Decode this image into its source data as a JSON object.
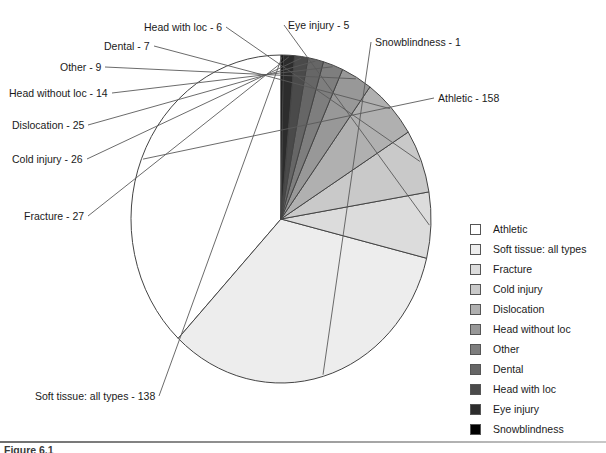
{
  "figure": {
    "caption": "Figure 6.1",
    "background": "#ffffff",
    "outline_color": "#444444"
  },
  "chart_data": {
    "type": "pie",
    "title": "",
    "total": 416,
    "units": "cases",
    "start_angle_deg": 90,
    "direction": "counterclockwise",
    "center": {
      "x": 281,
      "y": 219
    },
    "radius": {
      "rx": 150,
      "ry": 164
    },
    "categories": [
      "Athletic",
      "Soft tissue: all types",
      "Fracture",
      "Cold injury",
      "Dislocation",
      "Head without loc",
      "Other",
      "Dental",
      "Head with loc",
      "Eye injury",
      "Snowblindness"
    ],
    "values": [
      158,
      138,
      27,
      26,
      25,
      14,
      9,
      7,
      6,
      5,
      1
    ],
    "colors": [
      "#ffffff",
      "#ededed",
      "#dcdcdc",
      "#c9c9c9",
      "#b0b0b0",
      "#989898",
      "#7e7e7e",
      "#666666",
      "#4a4a4a",
      "#2c2c2c",
      "#000000"
    ],
    "legend_position": "right",
    "grid": false
  },
  "callouts": [
    {
      "text": "Athletic - 158",
      "x": 438,
      "y": 92
    },
    {
      "text": "Snowblindness - 1",
      "x": 375,
      "y": 36
    },
    {
      "text": "Eye injury - 5",
      "x": 288,
      "y": 19
    },
    {
      "text": "Head with loc - 6",
      "x": 144,
      "y": 21
    },
    {
      "text": "Dental - 7",
      "x": 104,
      "y": 40
    },
    {
      "text": "Other - 9",
      "x": 60,
      "y": 61
    },
    {
      "text": "Head without loc - 14",
      "x": 9,
      "y": 87
    },
    {
      "text": "Dislocation - 25",
      "x": 12,
      "y": 119
    },
    {
      "text": "Cold injury - 26",
      "x": 12,
      "y": 153
    },
    {
      "text": "Fracture - 27",
      "x": 24,
      "y": 210
    },
    {
      "text": "Soft tissue: all types - 138",
      "x": 35,
      "y": 390
    }
  ],
  "legend": {
    "items": [
      {
        "label": "Athletic",
        "color": "#ffffff"
      },
      {
        "label": "Soft tissue: all types",
        "color": "#ededed"
      },
      {
        "label": "Fracture",
        "color": "#dcdcdc"
      },
      {
        "label": "Cold injury",
        "color": "#c9c9c9"
      },
      {
        "label": "Dislocation",
        "color": "#b0b0b0"
      },
      {
        "label": "Head without loc",
        "color": "#989898"
      },
      {
        "label": "Other",
        "color": "#7e7e7e"
      },
      {
        "label": "Dental",
        "color": "#666666"
      },
      {
        "label": "Head with loc",
        "color": "#4a4a4a"
      },
      {
        "label": "Eye injury",
        "color": "#2c2c2c"
      },
      {
        "label": "Snowblindness",
        "color": "#000000"
      }
    ]
  }
}
